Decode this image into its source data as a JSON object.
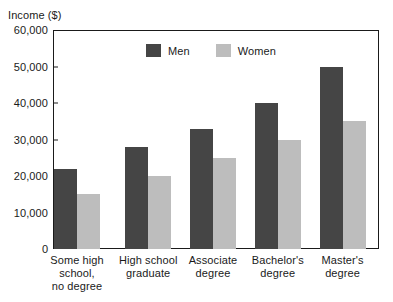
{
  "chart_data": {
    "type": "bar",
    "title": "",
    "xlabel": "",
    "ylabel": "Income ($)",
    "ylim": [
      0,
      60000
    ],
    "ytick_values": [
      0,
      10000,
      20000,
      30000,
      40000,
      50000,
      60000
    ],
    "ytick_labels": [
      "0",
      "10,000",
      "20,000",
      "30,000",
      "40,000",
      "50,000",
      "60,000"
    ],
    "grid": false,
    "legend_position": "upper center",
    "categories": [
      "Some high school, no degree",
      "High school graduate",
      "Associate degree",
      "Bachelor's degree",
      "Master's degree"
    ],
    "category_label_lines": [
      [
        "Some high",
        "school,",
        "no degree"
      ],
      [
        "High school",
        "graduate"
      ],
      [
        "Associate",
        "degree"
      ],
      [
        "Bachelor's",
        "degree"
      ],
      [
        "Master's",
        "degree"
      ]
    ],
    "series": [
      {
        "name": "Men",
        "color": "#454545",
        "values": [
          22000,
          28000,
          33000,
          40000,
          50000
        ]
      },
      {
        "name": "Women",
        "color": "#bdbdbd",
        "values": [
          15000,
          20000,
          25000,
          30000,
          35000
        ]
      }
    ]
  },
  "colors": {
    "men": "#454545",
    "women": "#bdbdbd",
    "axis": "#1a1a1a",
    "background": "#ffffff"
  }
}
